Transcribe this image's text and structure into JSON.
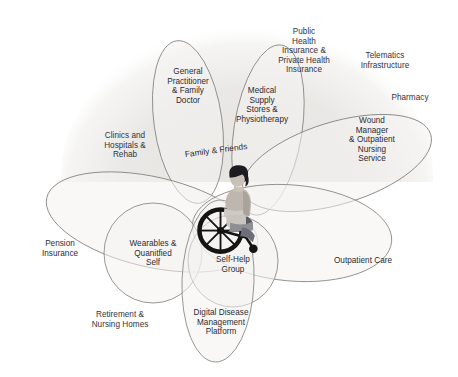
{
  "diagram": {
    "type": "venn-ecosystem-map",
    "center_figure": {
      "icon": "person-in-wheelchair",
      "description": "Person seated in a manual wheelchair at the centre of the diagram"
    },
    "backdrop": {
      "shape": "large soft grey dome behind the upper half",
      "color": "#e9e8e6"
    },
    "palette": {
      "stroke": "#87857f",
      "fill": "#f4f3f1",
      "text": "#2b2b33",
      "backdrop": "#e9e8e6",
      "page": "#ffffff"
    },
    "center_label": "Family & Friends",
    "ellipses": [
      {
        "id": "general-practitioner",
        "label": "General\nPractitioner\n& Family\nDoctor",
        "cx": 188,
        "cy": 122,
        "rx": 34,
        "ry": 82,
        "rot": -8,
        "label_x": 188,
        "label_y": 86
      },
      {
        "id": "medical-supply",
        "label": "Medical\nSupply\nStores &\nPhysiotherapy",
        "cx": 268,
        "cy": 130,
        "rx": 34,
        "ry": 86,
        "rot": 9,
        "label_x": 262,
        "label_y": 105
      },
      {
        "id": "wound-manager",
        "label": "Wound\nManager\n& Outpatient\nNursing\nService",
        "cx": 337,
        "cy": 163,
        "rx": 98,
        "ry": 41,
        "rot": -17,
        "label_x": 372,
        "label_y": 140
      },
      {
        "id": "pension-insurance",
        "label": "Pension\nInsurance",
        "cx": 152,
        "cy": 222,
        "rx": 108,
        "ry": 45,
        "rot": 13,
        "label_x": 60,
        "label_y": 249
      },
      {
        "id": "outpatient-care",
        "label": "Outpatient Care",
        "cx": 292,
        "cy": 233,
        "rx": 100,
        "ry": 48,
        "rot": 5,
        "label_x": 363,
        "label_y": 261
      },
      {
        "id": "wearables",
        "label": "Wearables &\nQuanitfied\nSelf",
        "cx": 153,
        "cy": 253,
        "rx": 49,
        "ry": 50,
        "rot": 0,
        "label_x": 153,
        "label_y": 253
      },
      {
        "id": "self-help-group",
        "label": "Self-Help\nGroup",
        "cx": 233,
        "cy": 261,
        "rx": 45,
        "ry": 46,
        "rot": 0,
        "label_x": 233,
        "label_y": 265
      },
      {
        "id": "digital-disease",
        "label": "Digital Disease\nManagement\nPlatform",
        "cx": 218,
        "cy": 281,
        "rx": 36,
        "ry": 81,
        "rot": 2,
        "label_x": 221,
        "label_y": 322
      }
    ],
    "outside_labels": [
      {
        "id": "public-health-insurance",
        "label": "Public\nHealth\nInsurance &\nPrivate Health\nInsurance",
        "x": 304,
        "y": 51
      },
      {
        "id": "telematics-infrastructure",
        "label": "Telematics\nInfrastructure",
        "x": 385,
        "y": 61
      },
      {
        "id": "pharmacy",
        "label": "Pharmacy",
        "x": 410,
        "y": 98
      },
      {
        "id": "clinics-hospitals-rehab",
        "label": "Clinics and\nHospitals &\nRehab",
        "x": 125,
        "y": 145
      },
      {
        "id": "retirement-nursing-homes",
        "label": "Retirement &\nNursing Homes",
        "x": 120,
        "y": 320
      }
    ]
  }
}
